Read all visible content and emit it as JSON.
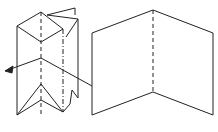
{
  "diagram": {
    "colors": {
      "stroke": "#222222",
      "fill": "#ffffff"
    },
    "elements": [
      {
        "id": "folded-prism",
        "type": "3d-folded-paper"
      },
      {
        "id": "arrow",
        "type": "arrow",
        "direction": "left"
      },
      {
        "id": "unfolded-sheet",
        "type": "open-folded-sheet",
        "fold": "dashed center line"
      }
    ]
  }
}
